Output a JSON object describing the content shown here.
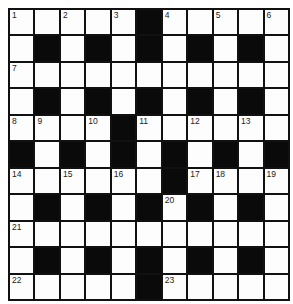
{
  "puzzle": {
    "rows": 11,
    "cols": 11,
    "layout": [
      ".....#.....",
      ".#.#.#.#.#.",
      "...........",
      ".#.#.#.#.#.",
      "....#......",
      "#.#.#.#.#.#",
      "......#....",
      ".#.#.#.#.#.",
      "...........",
      ".#.#.#.#.#.",
      ".....#....."
    ],
    "numbers": [
      {
        "r": 0,
        "c": 0,
        "n": "1"
      },
      {
        "r": 0,
        "c": 2,
        "n": "2"
      },
      {
        "r": 0,
        "c": 4,
        "n": "3"
      },
      {
        "r": 0,
        "c": 6,
        "n": "4"
      },
      {
        "r": 0,
        "c": 8,
        "n": "5"
      },
      {
        "r": 0,
        "c": 10,
        "n": "6"
      },
      {
        "r": 2,
        "c": 0,
        "n": "7"
      },
      {
        "r": 4,
        "c": 0,
        "n": "8"
      },
      {
        "r": 4,
        "c": 1,
        "n": "9"
      },
      {
        "r": 4,
        "c": 3,
        "n": "10"
      },
      {
        "r": 4,
        "c": 5,
        "n": "11"
      },
      {
        "r": 4,
        "c": 7,
        "n": "12"
      },
      {
        "r": 4,
        "c": 9,
        "n": "13"
      },
      {
        "r": 6,
        "c": 0,
        "n": "14"
      },
      {
        "r": 6,
        "c": 2,
        "n": "15"
      },
      {
        "r": 6,
        "c": 4,
        "n": "16"
      },
      {
        "r": 6,
        "c": 7,
        "n": "17"
      },
      {
        "r": 6,
        "c": 8,
        "n": "18"
      },
      {
        "r": 6,
        "c": 10,
        "n": "19"
      },
      {
        "r": 7,
        "c": 6,
        "n": "20"
      },
      {
        "r": 8,
        "c": 0,
        "n": "21"
      },
      {
        "r": 10,
        "c": 0,
        "n": "22"
      },
      {
        "r": 10,
        "c": 6,
        "n": "23"
      }
    ],
    "colors": {
      "block": "#0a0a0a",
      "cell": "#fdfdfd",
      "border": "#111111",
      "number_text": "#222222"
    }
  }
}
